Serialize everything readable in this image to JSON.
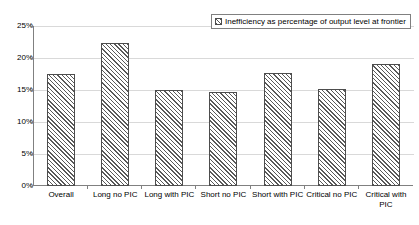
{
  "chart_data": {
    "type": "bar",
    "title": "",
    "xlabel": "",
    "ylabel": "",
    "ylim": [
      0,
      25
    ],
    "grid": true,
    "legend_position": "top-right",
    "categories": [
      "Overall",
      "Long no PIC",
      "Long with PIC",
      "Short no PIC",
      "Short with PIC",
      "Critical no PIC",
      "Critical with PIC"
    ],
    "series": [
      {
        "name": "Inefficiency as percentage of output level at frontier",
        "values": [
          17.5,
          22.4,
          15.0,
          14.7,
          17.6,
          15.1,
          19.1
        ]
      }
    ],
    "y_ticks": [
      {
        "value": 0,
        "label": "0%"
      },
      {
        "value": 5,
        "label": "5%"
      },
      {
        "value": 10,
        "label": "10%"
      },
      {
        "value": 15,
        "label": "15%"
      },
      {
        "value": 20,
        "label": "20%"
      },
      {
        "value": 25,
        "label": "25%"
      }
    ]
  },
  "legend": {
    "entries": [
      {
        "marker": "hatched-square-icon",
        "label": "Inefficiency as percentage of output level at frontier"
      }
    ]
  }
}
